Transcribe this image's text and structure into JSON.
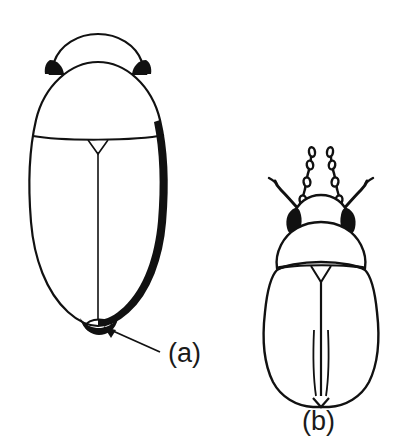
{
  "figure": {
    "type": "scientific-line-drawing",
    "background_color": "#ffffff",
    "ink_color": "#111111",
    "caption_labels": [
      {
        "id": "a",
        "text": "(a)",
        "x": 168,
        "y": 362
      },
      {
        "id": "b",
        "text": "(b)",
        "x": 302,
        "y": 430
      }
    ],
    "specimens": [
      {
        "id": "a",
        "name": "beetle-dorsal-stippled",
        "label": "(a)",
        "parts": [
          "head",
          "left-eye",
          "right-eye",
          "pronotum",
          "elytra",
          "scutellum",
          "elytral-suture",
          "pygidium"
        ],
        "shading": "stipple-gradient-right-and-lower-left",
        "bounds": {
          "x": 26,
          "y": 33,
          "width": 145,
          "height": 298
        }
      },
      {
        "id": "b",
        "name": "beetle-dorsal-outline",
        "label": "(b)",
        "parts": [
          "head",
          "left-eye",
          "right-eye",
          "left-antenna",
          "right-antenna",
          "left-palp",
          "right-palp",
          "pronotum",
          "elytra",
          "scutellum",
          "elytral-suture",
          "elytral-striae"
        ],
        "shading": "plain-outline",
        "bounds": {
          "x": 262,
          "y": 160,
          "width": 118,
          "height": 248
        }
      }
    ],
    "annotations": [
      {
        "name": "pygidium-pointer-arrow",
        "points_to": "pygidium",
        "from": {
          "x": 160,
          "y": 352
        },
        "to": {
          "x": 98,
          "y": 325
        }
      }
    ]
  }
}
